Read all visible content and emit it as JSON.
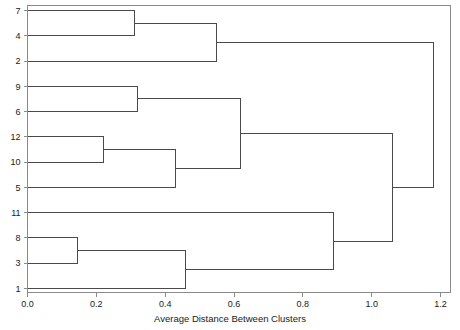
{
  "chart_data": {
    "type": "dendrogram",
    "title": "",
    "xlabel": "Average Distance Between Clusters",
    "ylabel": "",
    "xlim": [
      0.0,
      1.2
    ],
    "xticks": [
      0.0,
      0.2,
      0.4,
      0.6,
      0.8,
      1.0,
      1.2
    ],
    "xticklabels": [
      "0.0",
      "0.2",
      "0.4",
      "0.6",
      "0.8",
      "1.0",
      "1.2"
    ],
    "grid": false,
    "legend": null,
    "leaf_order": [
      "7",
      "4",
      "2",
      "9",
      "6",
      "12",
      "10",
      "5",
      "11",
      "8",
      "3",
      "1"
    ],
    "leaf_labels": [
      "7",
      "4",
      "2",
      "9",
      "6",
      "12",
      "10",
      "5",
      "11",
      "8",
      "3",
      "1"
    ],
    "merges": [
      {
        "id": "m1",
        "left": "7",
        "right": "4",
        "distance": 0.31
      },
      {
        "id": "m2",
        "left": "m1",
        "right": "2",
        "distance": 0.55
      },
      {
        "id": "m3",
        "left": "9",
        "right": "6",
        "distance": 0.32
      },
      {
        "id": "m4",
        "left": "12",
        "right": "10",
        "distance": 0.22
      },
      {
        "id": "m5",
        "left": "m4",
        "right": "5",
        "distance": 0.43
      },
      {
        "id": "m6",
        "left": "m3",
        "right": "m5",
        "distance": 0.62
      },
      {
        "id": "m7",
        "left": "8",
        "right": "3",
        "distance": 0.145
      },
      {
        "id": "m8",
        "left": "m7",
        "right": "1",
        "distance": 0.46
      },
      {
        "id": "m9",
        "left": "11",
        "right": "m8",
        "distance": 0.89
      },
      {
        "id": "m10",
        "left": "m6",
        "right": "m9",
        "distance": 1.06
      },
      {
        "id": "m11",
        "left": "m2",
        "right": "m10",
        "distance": 1.18
      }
    ]
  },
  "axis": {
    "xlabel": "Average Distance Between Clusters",
    "xticklabels": [
      "0.0",
      "0.2",
      "0.4",
      "0.6",
      "0.8",
      "1.0",
      "1.2"
    ],
    "yticklabels": [
      "7",
      "4",
      "2",
      "9",
      "6",
      "12",
      "10",
      "5",
      "11",
      "8",
      "3",
      "1"
    ]
  },
  "colors": {
    "line": "#4a4a4a",
    "frame": "#8a8a8a",
    "text": "#1a1a1a",
    "background": "#ffffff"
  }
}
